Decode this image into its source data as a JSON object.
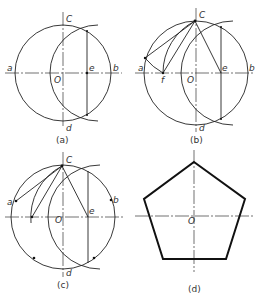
{
  "figure": {
    "panels": [
      {
        "id": "a",
        "caption": "(a)",
        "labels": {
          "top": "C",
          "left": "a",
          "center": "O",
          "right": "b",
          "bottom": "d",
          "midpoint": "e"
        }
      },
      {
        "id": "b",
        "caption": "(b)",
        "labels": {
          "top": "C",
          "left": "a",
          "center": "O",
          "right": "b",
          "bottom": "d",
          "midpoint": "e",
          "point_f": "f"
        }
      },
      {
        "id": "c",
        "caption": "(c)",
        "labels": {
          "top": "C",
          "left": "a",
          "center": "O",
          "right": "b",
          "bottom": "d",
          "midpoint": "e"
        }
      },
      {
        "id": "d",
        "caption": "(d)",
        "labels": {
          "center": "O"
        }
      }
    ]
  }
}
